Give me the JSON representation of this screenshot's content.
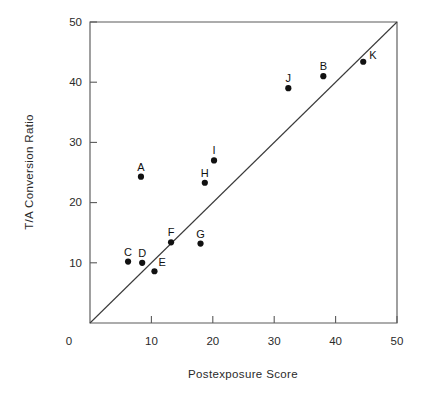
{
  "chart_data": {
    "type": "scatter",
    "title": "",
    "xlabel": "Postexposure Score",
    "ylabel": "T/A Conversion Ratio",
    "xlim": [
      0,
      50
    ],
    "ylim": [
      0,
      50
    ],
    "xticks": [
      0,
      10,
      20,
      30,
      40,
      50
    ],
    "yticks": [
      0,
      10,
      20,
      30,
      40,
      50
    ],
    "xtick_labels": [
      "0",
      "10",
      "20",
      "30",
      "40",
      "50"
    ],
    "ytick_labels": [
      "",
      "10",
      "20",
      "30",
      "40",
      "50"
    ],
    "grid": false,
    "legend": false,
    "reference_line": {
      "name": "identity-line",
      "from": [
        0,
        0
      ],
      "to": [
        50,
        50
      ],
      "label": ""
    },
    "points": [
      {
        "label": "A",
        "x": 8.3,
        "y": 24.3,
        "label_pos": "above"
      },
      {
        "label": "B",
        "x": 38.0,
        "y": 41.0,
        "label_pos": "above"
      },
      {
        "label": "C",
        "x": 6.2,
        "y": 10.2,
        "label_pos": "above"
      },
      {
        "label": "D",
        "x": 8.5,
        "y": 10.0,
        "label_pos": "above"
      },
      {
        "label": "E",
        "x": 10.5,
        "y": 8.6,
        "label_pos": "above-right"
      },
      {
        "label": "F",
        "x": 13.2,
        "y": 13.4,
        "label_pos": "above"
      },
      {
        "label": "G",
        "x": 18.0,
        "y": 13.2,
        "label_pos": "above"
      },
      {
        "label": "H",
        "x": 18.7,
        "y": 23.3,
        "label_pos": "above"
      },
      {
        "label": "I",
        "x": 20.2,
        "y": 27.0,
        "label_pos": "above"
      },
      {
        "label": "J",
        "x": 32.3,
        "y": 39.0,
        "label_pos": "above"
      },
      {
        "label": "K",
        "x": 44.5,
        "y": 43.4,
        "label_pos": "right"
      }
    ]
  },
  "colors": {
    "point": "#111111",
    "frame": "#5a5a5a",
    "reference_line": "#3a3a3a",
    "text": "#2a2a2a",
    "background": "#ffffff"
  }
}
